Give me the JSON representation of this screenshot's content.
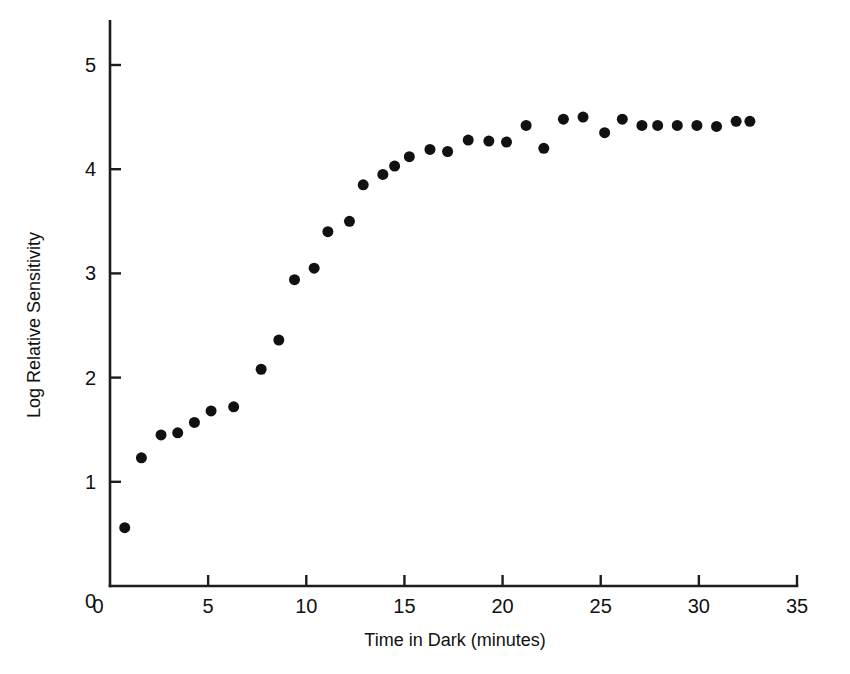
{
  "chart_data": {
    "type": "scatter",
    "title": "",
    "xlabel": "Time in Dark (minutes)",
    "ylabel": "Log Relative Sensitivity",
    "xlim": [
      0,
      35
    ],
    "ylim": [
      0,
      5.4
    ],
    "xticks": [
      0,
      5,
      10,
      15,
      20,
      25,
      30,
      35
    ],
    "yticks": [
      0,
      1,
      2,
      3,
      4,
      5
    ],
    "xtick_labels": [
      "0",
      "5",
      "10",
      "15",
      "20",
      "25",
      "30",
      "35"
    ],
    "ytick_labels": [
      "0",
      "1",
      "2",
      "3",
      "4",
      "5"
    ],
    "grid": false,
    "legend": false,
    "marker": "filled-circle",
    "marker_color": "#111111",
    "marker_size_px": 11,
    "x": [
      0.75,
      1.6,
      2.6,
      3.45,
      4.3,
      5.15,
      6.3,
      7.7,
      8.6,
      9.4,
      10.4,
      11.1,
      12.2,
      12.9,
      13.9,
      14.5,
      15.25,
      16.3,
      17.2,
      18.25,
      19.3,
      20.2,
      21.2,
      22.1,
      23.1,
      24.1,
      25.2,
      26.1,
      27.1,
      27.9,
      28.9,
      29.9,
      30.9,
      31.9,
      32.6
    ],
    "y": [
      0.56,
      1.23,
      1.45,
      1.47,
      1.57,
      1.68,
      1.72,
      2.08,
      2.36,
      2.94,
      3.05,
      3.4,
      3.5,
      3.85,
      3.95,
      4.03,
      4.12,
      4.19,
      4.17,
      4.28,
      4.27,
      4.26,
      4.42,
      4.2,
      4.48,
      4.5,
      4.35,
      4.48,
      4.42,
      4.42,
      4.42,
      4.42,
      4.41,
      4.46,
      4.46
    ],
    "points": [
      {
        "x": 0.75,
        "y": 0.56
      },
      {
        "x": 1.6,
        "y": 1.23
      },
      {
        "x": 2.6,
        "y": 1.45
      },
      {
        "x": 3.45,
        "y": 1.47
      },
      {
        "x": 4.3,
        "y": 1.57
      },
      {
        "x": 5.15,
        "y": 1.68
      },
      {
        "x": 6.3,
        "y": 1.72
      },
      {
        "x": 7.7,
        "y": 2.08
      },
      {
        "x": 8.6,
        "y": 2.36
      },
      {
        "x": 9.4,
        "y": 2.94
      },
      {
        "x": 10.4,
        "y": 3.05
      },
      {
        "x": 11.1,
        "y": 3.4
      },
      {
        "x": 12.2,
        "y": 3.5
      },
      {
        "x": 12.9,
        "y": 3.85
      },
      {
        "x": 13.9,
        "y": 3.95
      },
      {
        "x": 14.5,
        "y": 4.03
      },
      {
        "x": 15.25,
        "y": 4.12
      },
      {
        "x": 16.3,
        "y": 4.19
      },
      {
        "x": 17.2,
        "y": 4.17
      },
      {
        "x": 18.25,
        "y": 4.28
      },
      {
        "x": 19.3,
        "y": 4.27
      },
      {
        "x": 20.2,
        "y": 4.26
      },
      {
        "x": 21.2,
        "y": 4.42
      },
      {
        "x": 22.1,
        "y": 4.2
      },
      {
        "x": 23.1,
        "y": 4.48
      },
      {
        "x": 24.1,
        "y": 4.5
      },
      {
        "x": 25.2,
        "y": 4.35
      },
      {
        "x": 26.1,
        "y": 4.48
      },
      {
        "x": 27.1,
        "y": 4.42
      },
      {
        "x": 27.9,
        "y": 4.42
      },
      {
        "x": 28.9,
        "y": 4.42
      },
      {
        "x": 29.9,
        "y": 4.42
      },
      {
        "x": 30.9,
        "y": 4.41
      },
      {
        "x": 31.9,
        "y": 4.46
      },
      {
        "x": 32.6,
        "y": 4.46
      }
    ]
  }
}
